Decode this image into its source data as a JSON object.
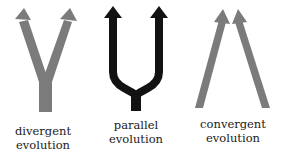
{
  "diagram": {
    "colors": {
      "gray_arrow": "#7b7b7b",
      "black_arrow": "#121212",
      "label_text": "#1a1a1a",
      "background": "#ffffff"
    },
    "panels": [
      {
        "id": "divergent",
        "shape": "Y (one stem splitting into two diverging arrows)",
        "color": "gray",
        "label_line1": "divergent",
        "label_line2": "evolution"
      },
      {
        "id": "parallel",
        "shape": "tuning fork (one stem splitting into two parallel upward arrows)",
        "color": "black",
        "label_line1": "parallel",
        "label_line2": "evolution"
      },
      {
        "id": "convergent",
        "shape": "two separate arrows converging toward each other",
        "color": "gray",
        "label_line1": "convergent",
        "label_line2": "evolution"
      }
    ]
  }
}
